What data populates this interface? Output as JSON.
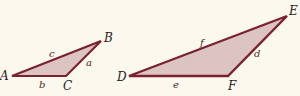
{
  "colors": {
    "background": "#fbf8ee",
    "stroke": "#7a2232",
    "fill": "#dcc4c2"
  },
  "triangles": [
    {
      "name": "triangle-abc",
      "vertices": [
        {
          "label": "A",
          "x": 12,
          "y": 76
        },
        {
          "label": "B",
          "x": 101,
          "y": 41
        },
        {
          "label": "C",
          "x": 66,
          "y": 76
        }
      ],
      "sides": [
        {
          "label": "c",
          "between": "A-B"
        },
        {
          "label": "a",
          "between": "B-C"
        },
        {
          "label": "b",
          "between": "A-C"
        }
      ]
    },
    {
      "name": "triangle-def",
      "vertices": [
        {
          "label": "D",
          "x": 129,
          "y": 76
        },
        {
          "label": "E",
          "x": 287,
          "y": 16
        },
        {
          "label": "F",
          "x": 228,
          "y": 76
        }
      ],
      "sides": [
        {
          "label": "f",
          "between": "D-E"
        },
        {
          "label": "d",
          "between": "E-F"
        },
        {
          "label": "e",
          "between": "D-F"
        }
      ]
    }
  ],
  "labels": {
    "A": "A",
    "B": "B",
    "C": "C",
    "a": "a",
    "b": "b",
    "c": "c",
    "D": "D",
    "E": "E",
    "F": "F",
    "d": "d",
    "e": "e",
    "f": "f"
  }
}
